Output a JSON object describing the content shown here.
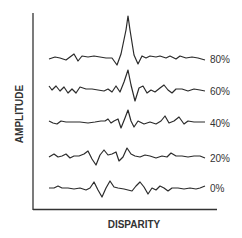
{
  "chart_data": {
    "type": "line",
    "title": "",
    "xlabel": "DISPARITY",
    "ylabel": "AMPLITUDE",
    "grid": false,
    "legend_position": "right (inline labels)",
    "axis_ticks": "none",
    "series": [
      {
        "name": "80%",
        "baseline_y": 58,
        "peak_x": 128,
        "peak_amplitude": 42,
        "points": [
          [
            49,
            59
          ],
          [
            55,
            57
          ],
          [
            60,
            58
          ],
          [
            66,
            60
          ],
          [
            70,
            57
          ],
          [
            74,
            54
          ],
          [
            78,
            61
          ],
          [
            82,
            56
          ],
          [
            88,
            57
          ],
          [
            94,
            56
          ],
          [
            100,
            57
          ],
          [
            106,
            58
          ],
          [
            112,
            58
          ],
          [
            117,
            65
          ],
          [
            121,
            54
          ],
          [
            126,
            30
          ],
          [
            128,
            16
          ],
          [
            130,
            30
          ],
          [
            134,
            55
          ],
          [
            138,
            64
          ],
          [
            142,
            56
          ],
          [
            146,
            58
          ],
          [
            150,
            56
          ],
          [
            156,
            57
          ],
          [
            160,
            56
          ],
          [
            166,
            58
          ],
          [
            170,
            56
          ],
          [
            176,
            59
          ],
          [
            180,
            56
          ],
          [
            186,
            58
          ],
          [
            192,
            57
          ],
          [
            198,
            58
          ],
          [
            205,
            60
          ]
        ]
      },
      {
        "name": "60%",
        "baseline_y": 90,
        "peak_x": 128,
        "peak_amplitude": 25,
        "points": [
          [
            49,
            86
          ],
          [
            52,
            90
          ],
          [
            56,
            86
          ],
          [
            60,
            91
          ],
          [
            64,
            87
          ],
          [
            68,
            93
          ],
          [
            72,
            89
          ],
          [
            76,
            93
          ],
          [
            80,
            87
          ],
          [
            86,
            89
          ],
          [
            92,
            89
          ],
          [
            98,
            90
          ],
          [
            104,
            91
          ],
          [
            108,
            89
          ],
          [
            112,
            92
          ],
          [
            116,
            86
          ],
          [
            120,
            92
          ],
          [
            124,
            82
          ],
          [
            128,
            70
          ],
          [
            131,
            85
          ],
          [
            135,
            101
          ],
          [
            139,
            88
          ],
          [
            143,
            86
          ],
          [
            147,
            93
          ],
          [
            151,
            90
          ],
          [
            155,
            92
          ],
          [
            160,
            88
          ],
          [
            164,
            85
          ],
          [
            168,
            90
          ],
          [
            172,
            93
          ],
          [
            176,
            89
          ],
          [
            182,
            89
          ],
          [
            188,
            91
          ],
          [
            194,
            89
          ],
          [
            200,
            90
          ],
          [
            205,
            91
          ]
        ]
      },
      {
        "name": "40%",
        "baseline_y": 123,
        "peak_x": 128,
        "peak_amplitude": 12,
        "points": [
          [
            49,
            121
          ],
          [
            53,
            123
          ],
          [
            57,
            124
          ],
          [
            61,
            121
          ],
          [
            66,
            122
          ],
          [
            72,
            122
          ],
          [
            80,
            122
          ],
          [
            88,
            123
          ],
          [
            95,
            122
          ],
          [
            101,
            121
          ],
          [
            105,
            121
          ],
          [
            108,
            119
          ],
          [
            111,
            123
          ],
          [
            114,
            121
          ],
          [
            118,
            119
          ],
          [
            121,
            128
          ],
          [
            125,
            118
          ],
          [
            128,
            110
          ],
          [
            131,
            121
          ],
          [
            134,
            127
          ],
          [
            138,
            121
          ],
          [
            144,
            124
          ],
          [
            150,
            122
          ],
          [
            156,
            124
          ],
          [
            161,
            121
          ],
          [
            165,
            116
          ],
          [
            169,
            123
          ],
          [
            174,
            121
          ],
          [
            179,
            117
          ],
          [
            184,
            124
          ],
          [
            188,
            121
          ],
          [
            194,
            122
          ],
          [
            200,
            122
          ],
          [
            205,
            122
          ]
        ]
      },
      {
        "name": "20%",
        "baseline_y": 158,
        "peak_x": null,
        "points": [
          [
            49,
            157
          ],
          [
            54,
            154
          ],
          [
            58,
            157
          ],
          [
            62,
            156
          ],
          [
            66,
            154
          ],
          [
            70,
            158
          ],
          [
            74,
            156
          ],
          [
            79,
            156
          ],
          [
            84,
            154
          ],
          [
            88,
            151
          ],
          [
            92,
            159
          ],
          [
            96,
            165
          ],
          [
            100,
            155
          ],
          [
            104,
            150
          ],
          [
            108,
            155
          ],
          [
            112,
            154
          ],
          [
            116,
            152
          ],
          [
            119,
            161
          ],
          [
            123,
            157
          ],
          [
            127,
            148
          ],
          [
            131,
            154
          ],
          [
            135,
            156
          ],
          [
            140,
            157
          ],
          [
            145,
            155
          ],
          [
            150,
            156
          ],
          [
            156,
            158
          ],
          [
            162,
            156
          ],
          [
            167,
            157
          ],
          [
            171,
            153
          ],
          [
            176,
            156
          ],
          [
            182,
            156
          ],
          [
            188,
            157
          ],
          [
            194,
            156
          ],
          [
            200,
            156
          ],
          [
            205,
            158
          ]
        ]
      },
      {
        "name": "0%",
        "baseline_y": 188,
        "peak_x": null,
        "points": [
          [
            49,
            188
          ],
          [
            54,
            188
          ],
          [
            58,
            186
          ],
          [
            62,
            188
          ],
          [
            68,
            188
          ],
          [
            74,
            189
          ],
          [
            80,
            188
          ],
          [
            86,
            190
          ],
          [
            90,
            188
          ],
          [
            94,
            182
          ],
          [
            98,
            190
          ],
          [
            102,
            197
          ],
          [
            106,
            188
          ],
          [
            110,
            181
          ],
          [
            114,
            187
          ],
          [
            118,
            188
          ],
          [
            124,
            189
          ],
          [
            128,
            190
          ],
          [
            132,
            191
          ],
          [
            136,
            186
          ],
          [
            140,
            182
          ],
          [
            144,
            187
          ],
          [
            148,
            194
          ],
          [
            152,
            188
          ],
          [
            156,
            190
          ],
          [
            160,
            186
          ],
          [
            164,
            188
          ],
          [
            168,
            191
          ],
          [
            172,
            188
          ],
          [
            178,
            188
          ],
          [
            184,
            189
          ],
          [
            190,
            188
          ],
          [
            196,
            189
          ],
          [
            200,
            188
          ],
          [
            205,
            186
          ]
        ]
      }
    ],
    "plot_area": {
      "x_axis_y": 209,
      "y_axis_x": 33,
      "x_start": 33,
      "x_end": 217,
      "y_top": 13,
      "y_bottom": 210
    }
  },
  "labels": {
    "series": [
      "80%",
      "60%",
      "40%",
      "20%",
      "0%"
    ],
    "xlabel": "DISPARITY",
    "ylabel": "AMPLITUDE"
  },
  "colors": {
    "trace": "#2b2b2b",
    "axis": "#333333",
    "text": "#333333",
    "background": "#ffffff"
  }
}
